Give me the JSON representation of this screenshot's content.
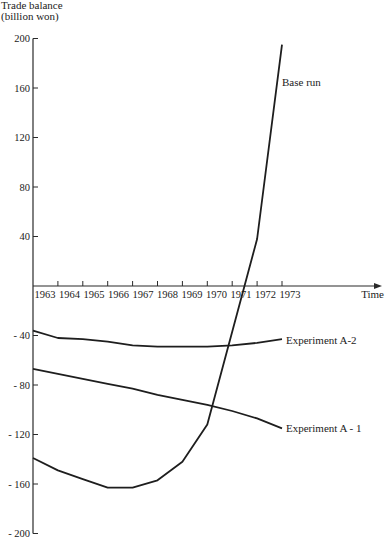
{
  "chart_data": {
    "type": "line",
    "title": "",
    "ylabel": "Trade balance (billion won)",
    "ylabel_lines": [
      "Trade balance",
      "(billion won)"
    ],
    "xlabel": "Time",
    "ylim": [
      -200,
      200
    ],
    "yticks": [
      200,
      160,
      120,
      80,
      40,
      -40,
      -80,
      -120,
      -160,
      -200
    ],
    "ytick_labels": [
      "200",
      "160",
      "120",
      "80",
      "40",
      "- 40",
      "- 80",
      "- 120",
      "- 160",
      "- 200"
    ],
    "x": [
      1963,
      1964,
      1965,
      1966,
      1967,
      1968,
      1969,
      1970,
      1971,
      1972,
      1973
    ],
    "xtick_labels": [
      "1963",
      "1964",
      "1965",
      "1966",
      "1967",
      "1968",
      "1969",
      "1970",
      "1971",
      "1972",
      "1973"
    ],
    "grid": false,
    "legend_position": "inline labels at line ends",
    "series": [
      {
        "name": "Base run",
        "values": [
          -139,
          -149,
          -156,
          -163,
          -163,
          -157,
          -142,
          -112,
          -37,
          38,
          195
        ]
      },
      {
        "name": "Experiment A-2",
        "values": [
          -36,
          -42,
          -43,
          -45,
          -48,
          -49,
          -49,
          -49,
          -48,
          -46,
          -43
        ]
      },
      {
        "name": "Experiment A - 1",
        "values": [
          -67,
          -71,
          -75,
          -79,
          -83,
          -88,
          -92,
          -96,
          -101,
          -107,
          -115
        ]
      }
    ]
  }
}
